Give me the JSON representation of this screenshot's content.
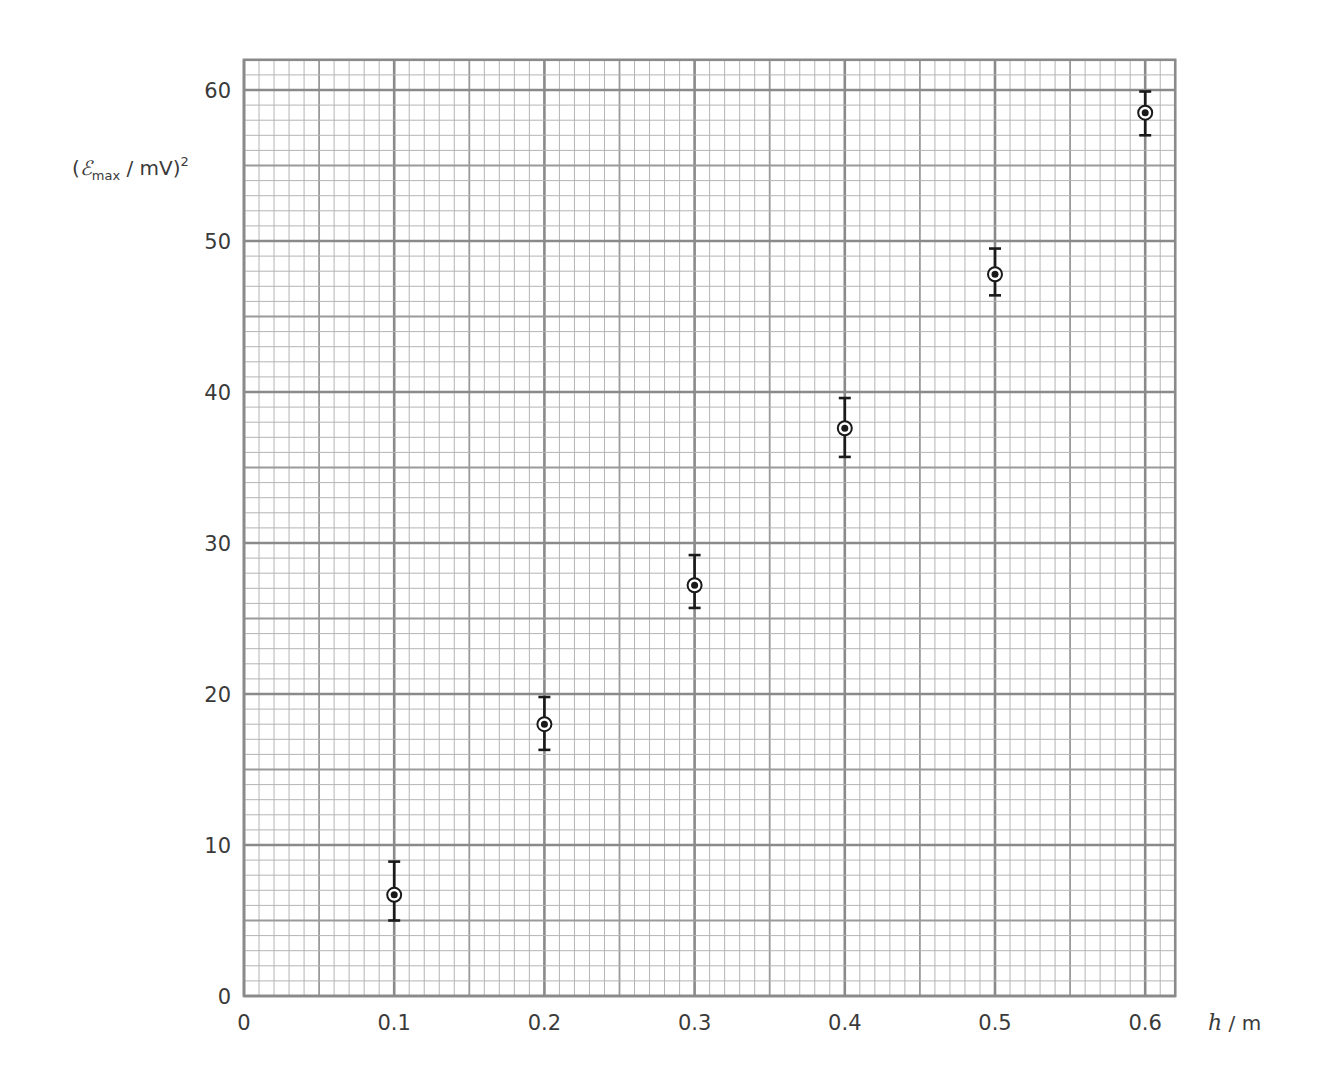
{
  "chart_data": {
    "type": "scatter",
    "title": "",
    "xlabel": "h / m",
    "xlabel_parts": {
      "var": "h",
      "unit": " / m"
    },
    "ylabel": "(Emax / mV)²",
    "ylabel_parts": {
      "open": "(",
      "symbol": "ℰ",
      "subscript": "max",
      "unit": " / mV)",
      "sup": "2"
    },
    "xlim": [
      0,
      0.62
    ],
    "ylim": [
      0,
      62
    ],
    "grid": true,
    "grid_style": "graph paper: minor every 0.01 / 1, medium every 0.05 / 5, major every 0.1 / 10",
    "legend": null,
    "x_ticks": [
      0,
      0.1,
      0.2,
      0.3,
      0.4,
      0.5,
      0.6
    ],
    "x_tick_labels": [
      "0",
      "0.1",
      "0.2",
      "0.3",
      "0.4",
      "0.5",
      "0.6"
    ],
    "y_ticks": [
      0,
      10,
      20,
      30,
      40,
      50,
      60
    ],
    "y_tick_labels": [
      "0",
      "10",
      "20",
      "30",
      "40",
      "50",
      "60"
    ],
    "marker": "circled dot",
    "series": [
      {
        "name": "data",
        "x": [
          0.1,
          0.2,
          0.3,
          0.4,
          0.5,
          0.6
        ],
        "y": [
          6.7,
          18.0,
          27.2,
          37.6,
          47.8,
          58.5
        ],
        "y_err_upper": [
          8.9,
          19.8,
          29.2,
          39.6,
          49.5,
          59.9
        ],
        "y_err_lower": [
          5.0,
          16.3,
          25.7,
          35.7,
          46.4,
          57.0
        ]
      }
    ]
  },
  "colors": {
    "minor_grid": "#b4b4b4",
    "medium_grid": "#9a9a9a",
    "major_grid": "#8a8a8a",
    "border": "#8a8a8a",
    "marker": "#1a1a1a",
    "text": "#3a3a3a"
  }
}
